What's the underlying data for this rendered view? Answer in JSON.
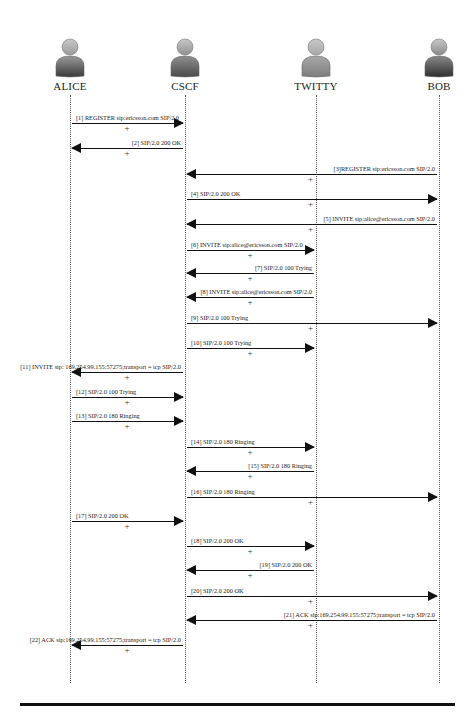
{
  "diagram": {
    "type": "sequence",
    "actors": [
      {
        "id": "alice",
        "label": "ALICE",
        "x": 70,
        "color_top": "#9a9a9a",
        "color_bottom": "#3a3a3a"
      },
      {
        "id": "cscf",
        "label": "CSCF",
        "x": 185,
        "color_top": "#8f8f8f",
        "color_bottom": "#4a4a4a"
      },
      {
        "id": "twitty",
        "label": "TWITTY",
        "x": 316,
        "color_top": "#a8a8a8",
        "color_bottom": "#7d7d7d"
      },
      {
        "id": "bob",
        "label": "BOB",
        "x": 439,
        "color_top": "#8a8a8a",
        "color_bottom": "#2e2e2e"
      }
    ],
    "messages": [
      {
        "n": 1,
        "label": "[1] REGISTER sip:ericsson.com SIP/2.0",
        "from": "alice",
        "to": "cscf",
        "y": 123
      },
      {
        "n": 2,
        "label": "[2] SIP/2.0 200 OK",
        "from": "cscf",
        "to": "alice",
        "y": 148
      },
      {
        "n": 3,
        "label": "[3]REGISTER sip:ericsson.com SIP/2.0",
        "from": "bob",
        "to": "cscf",
        "y": 174
      },
      {
        "n": 4,
        "label": "[4] SIP/2.0 200 OK",
        "from": "cscf",
        "to": "bob",
        "y": 199
      },
      {
        "n": 5,
        "label": "[5] INVITE sip:alice@ericsson.com SIP/2.0",
        "from": "bob",
        "to": "cscf",
        "y": 224
      },
      {
        "n": 6,
        "label": "[6] INVITE sip:alice@ericsson.com SIP/2.0",
        "from": "cscf",
        "to": "twitty",
        "y": 250
      },
      {
        "n": 7,
        "label": "[7] SIP/2.0 100 Trying",
        "from": "twitty",
        "to": "cscf",
        "y": 273
      },
      {
        "n": 8,
        "label": "[8] INVITE sip:alice@ericsson.com SIP/2.0",
        "from": "twitty",
        "to": "cscf",
        "y": 297
      },
      {
        "n": 9,
        "label": "[9] SIP/2.0 100 Trying",
        "from": "cscf",
        "to": "bob",
        "y": 323
      },
      {
        "n": 10,
        "label": "[10] SIP/2.0 100 Trying",
        "from": "cscf",
        "to": "twitty",
        "y": 348
      },
      {
        "n": 11,
        "label": "[11] INVITE sip: 169.254.99.155:57275;transport = tcp SIP/2.0",
        "from": "cscf",
        "to": "alice",
        "y": 372
      },
      {
        "n": 12,
        "label": "[12] SIP/2.0 100 Trying",
        "from": "alice",
        "to": "cscf",
        "y": 397
      },
      {
        "n": 13,
        "label": "[13] SIP/2.0 180 Ringing",
        "from": "alice",
        "to": "cscf",
        "y": 421
      },
      {
        "n": 14,
        "label": "[14] SIP/2.0 180 Ringing",
        "from": "cscf",
        "to": "twitty",
        "y": 447
      },
      {
        "n": 15,
        "label": "[15] SIP/2.0 180 Ringing",
        "from": "twitty",
        "to": "cscf",
        "y": 471
      },
      {
        "n": 16,
        "label": "[16] SIP/2.0 180 Ringing",
        "from": "cscf",
        "to": "bob",
        "y": 497
      },
      {
        "n": 17,
        "label": "[17] SIP/2.0 200 OK",
        "from": "alice",
        "to": "cscf",
        "y": 521
      },
      {
        "n": 18,
        "label": "[18] SIP/2.0 200 OK",
        "from": "cscf",
        "to": "twitty",
        "y": 546
      },
      {
        "n": 19,
        "label": "[19] SIP/2.0 200 OK",
        "from": "twitty",
        "to": "cscf",
        "y": 570
      },
      {
        "n": 20,
        "label": "[20] SIP/2.0 200 OK",
        "from": "cscf",
        "to": "bob",
        "y": 596
      },
      {
        "n": 21,
        "label": "[21] ACK sip:169.254.99.155:57275;transport = tcp SIP/2.0",
        "from": "bob",
        "to": "cscf",
        "y": 620
      },
      {
        "n": 22,
        "label": "[22] ACK sip:169.254.99.155:57275;transport = tcp SIP/2.0",
        "from": "cscf",
        "to": "alice",
        "y": 645
      }
    ],
    "colors": {
      "arrow": "#111111",
      "lifeline": "#555555",
      "rule": "#111111"
    }
  }
}
